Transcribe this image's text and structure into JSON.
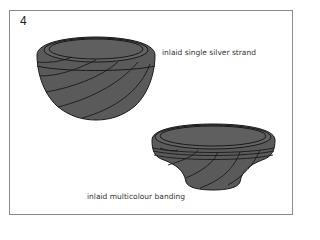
{
  "figure": {
    "number": "4",
    "labels": {
      "top_bowl": "inlaid single silver strand",
      "bottom_bowl": "inlaid multicolour banding"
    },
    "colors": {
      "bowl_fill": "#5a5a5a",
      "rim_fill": "#636363",
      "line": "#1a1a1a",
      "frame": "#8a8a8a"
    }
  }
}
